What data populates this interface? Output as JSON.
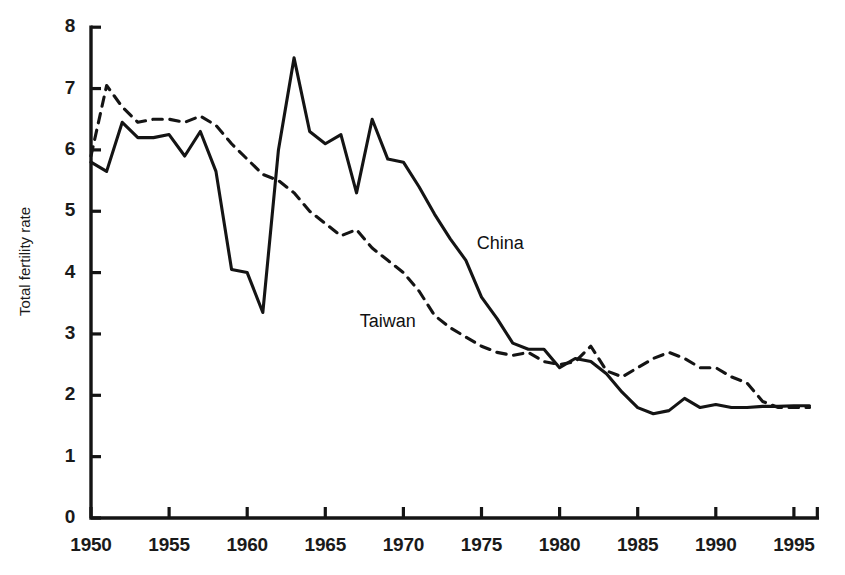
{
  "chart_data": {
    "type": "line",
    "title": "",
    "xlabel": "",
    "ylabel": "Total fertility rate",
    "xlim": [
      1950,
      1996.5
    ],
    "ylim": [
      0,
      8
    ],
    "grid": false,
    "legend_position": "inline-annotation",
    "xticks": [
      1950,
      1955,
      1960,
      1965,
      1970,
      1975,
      1980,
      1985,
      1990,
      1995
    ],
    "xtick_labels": [
      "1950",
      "1955",
      "1960",
      "1965",
      "1970",
      "1975",
      "1980",
      "1985",
      "1990",
      "1995"
    ],
    "yticks": [
      0,
      1,
      2,
      3,
      4,
      5,
      6,
      7,
      8
    ],
    "ytick_labels": [
      "0",
      "1",
      "2",
      "3",
      "4",
      "5",
      "6",
      "7",
      "8"
    ],
    "annotations": [
      {
        "text": "China",
        "x": 1974.7,
        "y": 4.45
      },
      {
        "text": "Taiwan",
        "x": 1967.2,
        "y": 3.18
      }
    ],
    "series": [
      {
        "name": "China",
        "style": "solid",
        "color": "#141414",
        "x": [
          1950,
          1951,
          1952,
          1953,
          1954,
          1955,
          1956,
          1957,
          1958,
          1959,
          1960,
          1961,
          1962,
          1963,
          1964,
          1965,
          1966,
          1967,
          1968,
          1969,
          1970,
          1971,
          1972,
          1973,
          1974,
          1975,
          1976,
          1977,
          1978,
          1979,
          1980,
          1981,
          1982,
          1983,
          1984,
          1985,
          1986,
          1987,
          1988,
          1989,
          1990,
          1991,
          1992,
          1993,
          1994,
          1995,
          1996
        ],
        "y": [
          5.8,
          5.65,
          6.45,
          6.2,
          6.2,
          6.25,
          5.9,
          6.3,
          5.65,
          4.05,
          4.0,
          3.35,
          6.0,
          7.5,
          6.3,
          6.1,
          6.25,
          5.3,
          6.5,
          5.85,
          5.8,
          5.4,
          4.95,
          4.55,
          4.2,
          3.6,
          3.25,
          2.85,
          2.75,
          2.75,
          2.45,
          2.6,
          2.55,
          2.35,
          2.05,
          1.8,
          1.7,
          1.75,
          1.95,
          1.8,
          1.85,
          1.8,
          1.8,
          1.82,
          1.82,
          1.83,
          1.83
        ]
      },
      {
        "name": "Taiwan",
        "style": "dashed",
        "color": "#141414",
        "x": [
          1950,
          1951,
          1952,
          1953,
          1954,
          1955,
          1956,
          1957,
          1958,
          1959,
          1960,
          1961,
          1962,
          1963,
          1964,
          1965,
          1966,
          1967,
          1968,
          1969,
          1970,
          1971,
          1972,
          1973,
          1974,
          1975,
          1976,
          1977,
          1978,
          1979,
          1980,
          1981,
          1982,
          1983,
          1984,
          1985,
          1986,
          1987,
          1988,
          1989,
          1990,
          1991,
          1992,
          1993,
          1994,
          1995,
          1996
        ],
        "y": [
          5.9,
          7.05,
          6.7,
          6.45,
          6.5,
          6.5,
          6.45,
          6.55,
          6.4,
          6.1,
          5.85,
          5.6,
          5.5,
          5.3,
          5.0,
          4.8,
          4.6,
          4.7,
          4.4,
          4.2,
          4.0,
          3.7,
          3.3,
          3.1,
          2.95,
          2.8,
          2.7,
          2.65,
          2.7,
          2.55,
          2.5,
          2.55,
          2.8,
          2.4,
          2.3,
          2.45,
          2.6,
          2.7,
          2.6,
          2.45,
          2.45,
          2.3,
          2.2,
          1.9,
          1.8,
          1.8,
          1.8
        ]
      }
    ]
  },
  "axis": {
    "y_title": "Total fertility rate"
  }
}
